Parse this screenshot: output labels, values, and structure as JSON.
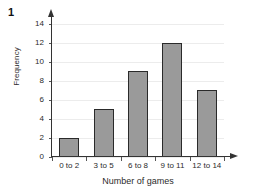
{
  "question_number": "1",
  "chart_data": {
    "type": "bar",
    "title": "",
    "xlabel": "Number of games",
    "ylabel": "Frequency",
    "categories": [
      "0 to 2",
      "3 to 5",
      "6 to 8",
      "9 to 11",
      "12 to 14"
    ],
    "values": [
      2,
      5,
      9,
      12,
      7
    ],
    "ylim": [
      0,
      15
    ],
    "ytick_values": [
      0,
      2,
      4,
      6,
      8,
      10,
      12,
      14
    ],
    "ytick_labels": [
      "0",
      "2",
      "4",
      "6",
      "8",
      "10",
      "12",
      "14"
    ],
    "grid": true,
    "legend": "none",
    "bar_color": "#9a9a9a",
    "bar_edge_color": "#2a2a2a",
    "axis_color": "#333333",
    "gridline_color": "#ececec",
    "background_color": "#ffffff"
  }
}
